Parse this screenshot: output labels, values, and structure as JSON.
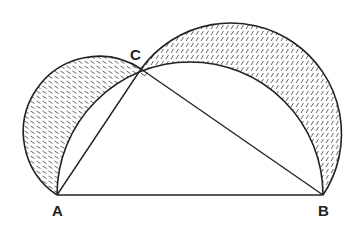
{
  "diagram": {
    "type": "geometry",
    "points": {
      "A": {
        "label": "A",
        "x": 57,
        "y": 195
      },
      "B": {
        "label": "B",
        "x": 323,
        "y": 195
      },
      "C": {
        "label": "C",
        "x": 141,
        "y": 69
      }
    },
    "segments": [
      {
        "from": "A",
        "to": "B"
      },
      {
        "from": "A",
        "to": "C"
      },
      {
        "from": "C",
        "to": "B"
      }
    ],
    "right_angle_marker": {
      "at": "C"
    },
    "regions": [
      {
        "name": "lune-on-AC",
        "shaded": true,
        "hatch": "backslash"
      },
      {
        "name": "lune-on-BC",
        "shaded": true,
        "hatch": "slash"
      }
    ],
    "colors": {
      "stroke": "#222222",
      "hatch": "#444444",
      "background": "#ffffff"
    }
  }
}
